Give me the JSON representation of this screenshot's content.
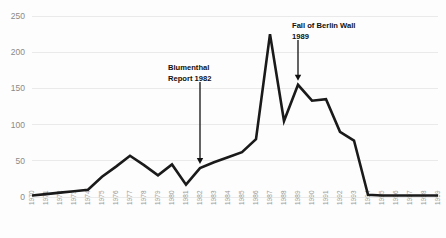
{
  "chart_data": {
    "type": "line",
    "title": "",
    "subtitle": "",
    "xlabel": "",
    "ylabel": "",
    "ylim": [
      0,
      250
    ],
    "yticks": [
      0,
      50,
      100,
      150,
      200,
      250
    ],
    "grid": true,
    "legend": false,
    "legend_position": "none",
    "line_color": "#1a1a1a",
    "grid_color": "#eaeaea",
    "background_color": "#fdfdfd",
    "x": [
      1970,
      1971,
      1972,
      1973,
      1974,
      1975,
      1976,
      1977,
      1978,
      1979,
      1980,
      1981,
      1982,
      1983,
      1984,
      1985,
      1986,
      1987,
      1988,
      1989,
      1990,
      1991,
      1992,
      1993,
      1994,
      1995,
      1996,
      1997,
      1998,
      1999
    ],
    "categories": [
      "1970",
      "1971",
      "1972",
      "1973",
      "1974",
      "1975",
      "1976",
      "1977",
      "1978",
      "1979",
      "1980",
      "1981",
      "1982",
      "1983",
      "1984",
      "1985",
      "1986",
      "1987",
      "1988",
      "1989",
      "1990",
      "1991",
      "1992",
      "1993",
      "1994",
      "1995",
      "1996",
      "1997",
      "1998",
      "1999"
    ],
    "values": [
      2,
      4,
      6,
      8,
      10,
      28,
      42,
      57,
      44,
      30,
      45,
      17,
      40,
      48,
      55,
      62,
      80,
      225,
      105,
      155,
      133,
      135,
      90,
      78,
      3,
      2,
      2,
      2,
      2,
      2
    ],
    "series": [
      {
        "name": "",
        "values": [
          2,
          4,
          6,
          8,
          10,
          28,
          42,
          57,
          44,
          30,
          45,
          17,
          40,
          48,
          55,
          62,
          80,
          225,
          105,
          155,
          133,
          135,
          90,
          78,
          3,
          2,
          2,
          2,
          2,
          2
        ]
      }
    ],
    "annotations": [
      {
        "id": "blumenthal",
        "lines": [
          "Blumenthal",
          "Report 1982"
        ],
        "line1": "Blumenthal",
        "line2": "Report 1982",
        "target_x": 1982,
        "target_value": 40,
        "arrow": "down"
      },
      {
        "id": "berlin-wall",
        "lines": [
          "Fall of Berlin Wall",
          "1989"
        ],
        "line1": "Fall of Berlin Wall",
        "line2": "1989",
        "target_x": 1989,
        "target_value": 155,
        "arrow": "down"
      }
    ]
  }
}
